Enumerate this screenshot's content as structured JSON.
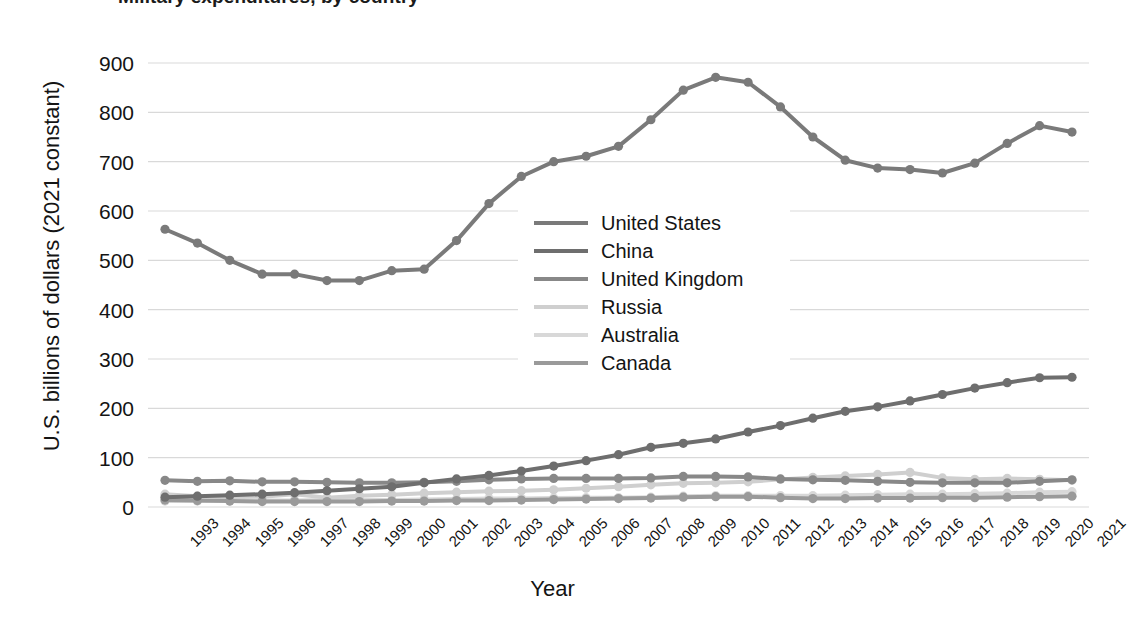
{
  "chart_data": {
    "type": "line",
    "title": "Military expenditures, by country",
    "xlabel": "Year",
    "ylabel": "U.S. billions of dollars (2021 constant)",
    "x": [
      1993,
      1994,
      1995,
      1996,
      1997,
      1998,
      1999,
      2000,
      2001,
      2002,
      2003,
      2004,
      2005,
      2006,
      2007,
      2008,
      2009,
      2010,
      2011,
      2012,
      2013,
      2014,
      2015,
      2016,
      2017,
      2018,
      2019,
      2020,
      2021
    ],
    "xtick_labels": [
      "1993",
      "1994",
      "1995",
      "1996",
      "1997",
      "1998",
      "1999",
      "2000",
      "2001",
      "2002",
      "2003",
      "2004",
      "2005",
      "2006",
      "2007",
      "2008",
      "2009",
      "2010",
      "2011",
      "2012",
      "2013",
      "2014",
      "2015",
      "2016",
      "2017",
      "2018",
      "2019",
      "2020",
      "2021"
    ],
    "ytick_labels": [
      "900",
      "800",
      "700",
      "600",
      "500",
      "400",
      "300",
      "200",
      "100",
      "0"
    ],
    "yticks": [
      900,
      800,
      700,
      600,
      500,
      400,
      300,
      200,
      100,
      0
    ],
    "ylim": [
      0,
      900
    ],
    "grid": true,
    "legend_position": "center",
    "markers": true,
    "series": [
      {
        "name": "United States",
        "color": "#7a7a7a",
        "width": 4,
        "values": [
          563,
          535,
          500,
          472,
          472,
          459,
          459,
          479,
          482,
          540,
          615,
          670,
          700,
          711,
          731,
          785,
          845,
          871,
          861,
          811,
          750,
          703,
          687,
          684,
          677,
          697,
          737,
          773,
          760
        ]
      },
      {
        "name": "China",
        "color": "#6e6e6e",
        "width": 4,
        "values": [
          20,
          22,
          24,
          26,
          29,
          33,
          37,
          41,
          49,
          57,
          64,
          73,
          83,
          94,
          106,
          121,
          129,
          138,
          152,
          165,
          180,
          194,
          203,
          215,
          228,
          241,
          252,
          262,
          263
        ]
      },
      {
        "name": "United Kingdom",
        "color": "#888888",
        "width": 4,
        "values": [
          54,
          52,
          53,
          51,
          51,
          50,
          49,
          49,
          50,
          52,
          55,
          57,
          58,
          58,
          58,
          59,
          62,
          62,
          61,
          57,
          55,
          54,
          52,
          50,
          49,
          49,
          49,
          52,
          55
        ]
      },
      {
        "name": "Russia",
        "color": "#cfcfcf",
        "width": 4,
        "values": [
          26,
          22,
          20,
          21,
          26,
          19,
          23,
          25,
          28,
          30,
          32,
          33,
          35,
          38,
          41,
          45,
          48,
          49,
          51,
          56,
          60,
          63,
          66,
          70,
          59,
          56,
          58,
          56,
          54
        ]
      },
      {
        "name": "Australia",
        "color": "#d8d8d8",
        "width": 4,
        "values": [
          12,
          12,
          12,
          13,
          13,
          14,
          14,
          14,
          15,
          16,
          17,
          17,
          18,
          19,
          19,
          20,
          22,
          23,
          23,
          23,
          23,
          24,
          25,
          26,
          26,
          27,
          28,
          30,
          31
        ]
      },
      {
        "name": "Canada",
        "color": "#9a9a9a",
        "width": 4,
        "values": [
          14,
          13,
          12,
          11,
          11,
          11,
          11,
          12,
          12,
          13,
          13,
          14,
          15,
          16,
          17,
          18,
          20,
          21,
          21,
          19,
          17,
          17,
          18,
          18,
          19,
          19,
          20,
          21,
          22
        ]
      }
    ]
  },
  "axes": {
    "y_title": "U.S. billions of dollars (2021 constant)",
    "x_title": "Year"
  },
  "legend": {
    "items": [
      {
        "label": "United States"
      },
      {
        "label": "China"
      },
      {
        "label": "United Kingdom"
      },
      {
        "label": "Russia"
      },
      {
        "label": "Australia"
      },
      {
        "label": "Canada"
      }
    ]
  },
  "style": {
    "grid_color": "#d9d9d9",
    "text_color": "#141414",
    "background": "#ffffff"
  }
}
